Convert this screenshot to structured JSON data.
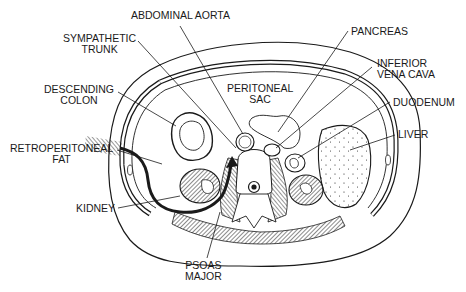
{
  "figure": {
    "colors": {
      "ink": "#1a1a1a",
      "background": "#ffffff"
    },
    "labels": {
      "abdominal_aorta": [
        "ABDOMINAL AORTA"
      ],
      "sympathetic_trunk": [
        "SYMPATHETIC",
        "TRUNK"
      ],
      "descending_colon": [
        "DESCENDING",
        "COLON"
      ],
      "retroperitoneal_fat": [
        "RETROPERITONEAL",
        "FAT"
      ],
      "kidney": [
        "KIDNEY"
      ],
      "psoas_major": [
        "PSOAS",
        "MAJOR"
      ],
      "peritoneal_sac": [
        "PERITONEAL",
        "SAC"
      ],
      "pancreas": [
        "PANCREAS"
      ],
      "inferior_vena_cava": [
        "INFERIOR",
        "VENA CAVA"
      ],
      "duodenum": [
        "DUODENUM"
      ],
      "liver": [
        "LIVER"
      ]
    }
  }
}
